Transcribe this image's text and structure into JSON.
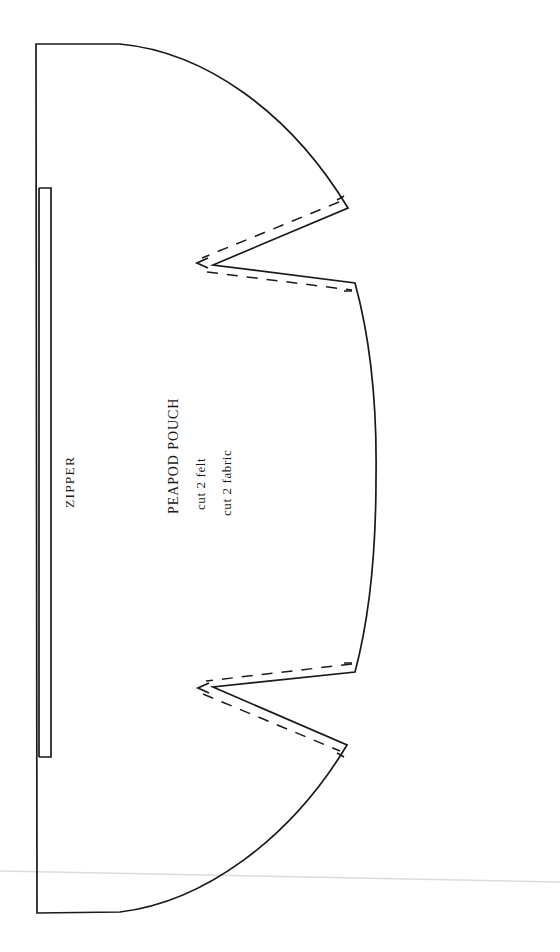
{
  "document": {
    "kind": "sewing-pattern-sheet",
    "title": "PEAPOD POUCH",
    "background_color": "#ffffff",
    "ink_color": "#1a1a1a",
    "artifact_color": "#dcdcdc",
    "page_width": 560,
    "page_height": 952
  },
  "labels": {
    "zipper": "ZIPPER",
    "pattern_name": "PEAPOD POUCH",
    "cut_instruction_1": "cut 2 felt",
    "cut_instruction_2": "cut 2 fabric"
  },
  "pattern": {
    "piece_name": "PEAPOD POUCH",
    "fold_edge": "left vertical straight edge",
    "cut_line_style": "solid",
    "seam_line_style": "dashed",
    "notch_marker": "<",
    "notch_count": 2,
    "outline_points": {
      "top_left": [
        36,
        44
      ],
      "top_arc_end": [
        348,
        208
      ],
      "upper_notch_tip": [
        213,
        265
      ],
      "upper_notch_outer": [
        355,
        283
      ],
      "belly_bulge": [
        376,
        478
      ],
      "lower_notch_outer": [
        355,
        672
      ],
      "lower_notch_tip": [
        213,
        687
      ],
      "bottom_arc_start": [
        347,
        745
      ],
      "bottom_left": [
        37,
        913
      ]
    },
    "zipper_bracket": {
      "top": 188,
      "bottom": 757,
      "left": 39,
      "right": 51
    }
  }
}
